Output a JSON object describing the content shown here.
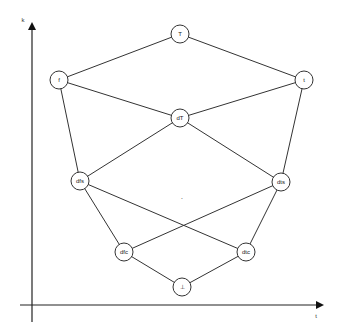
{
  "diagram": {
    "type": "lattice",
    "axes": {
      "y_label": "k",
      "x_label": "t"
    },
    "nodes": [
      {
        "id": "T",
        "label": "T",
        "x": 180,
        "y": 34
      },
      {
        "id": "f",
        "label": "f",
        "x": 59,
        "y": 80
      },
      {
        "id": "t",
        "label": "t",
        "x": 304,
        "y": 80
      },
      {
        "id": "dT",
        "label": "dT",
        "x": 180,
        "y": 118
      },
      {
        "id": "dfs",
        "label": "dfs",
        "x": 80,
        "y": 181
      },
      {
        "id": "dts",
        "label": "dts",
        "x": 281,
        "y": 182
      },
      {
        "id": "dfc",
        "label": "dfc",
        "x": 124,
        "y": 252
      },
      {
        "id": "dtc",
        "label": "dtc",
        "x": 246,
        "y": 252
      },
      {
        "id": "bottom",
        "label": "⊥",
        "x": 182,
        "y": 287
      }
    ],
    "crossing": {
      "label": "·",
      "x": 181,
      "y": 206
    },
    "edges": [
      [
        "T",
        "f"
      ],
      [
        "T",
        "t"
      ],
      [
        "f",
        "dT"
      ],
      [
        "t",
        "dT"
      ],
      [
        "f",
        "dfs"
      ],
      [
        "t",
        "dts"
      ],
      [
        "dT",
        "dfs"
      ],
      [
        "dT",
        "dts"
      ],
      [
        "dfs",
        "dtc"
      ],
      [
        "dts",
        "dfc"
      ],
      [
        "dfs",
        "dfc"
      ],
      [
        "dts",
        "dtc"
      ],
      [
        "dfc",
        "bottom"
      ],
      [
        "dtc",
        "bottom"
      ]
    ]
  }
}
